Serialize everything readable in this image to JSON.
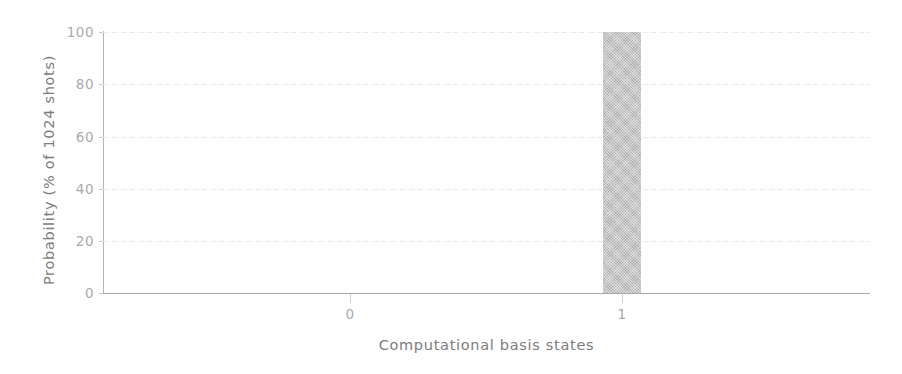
{
  "chart_data": {
    "type": "bar",
    "title": "",
    "subtitle": "",
    "xlabel": "Computational basis states",
    "ylabel": "Probability (% of 1024 shots)",
    "categories": [
      "0",
      "1"
    ],
    "values": [
      0,
      100
    ],
    "series": [
      {
        "name": "Probability",
        "values": [
          0,
          100
        ]
      }
    ],
    "ylim": [
      0,
      100
    ],
    "yticks": [
      0,
      20,
      40,
      60,
      80,
      100
    ],
    "ytick_labels": [
      "0",
      "20",
      "40",
      "60",
      "80",
      "100"
    ],
    "xtick_labels": [
      "0",
      "1"
    ],
    "grid": true,
    "grid_axis": "y",
    "legend": false,
    "legend_position": "none",
    "bar_color": "#b9b9b9",
    "axis_color": "#b0b0b0",
    "grid_color": "#eaeaea",
    "text_color": "#8a8a8a",
    "background": "#fefefe",
    "annotations": []
  },
  "figure": {
    "y_axis_title": "Probability (% of 1024 shots)",
    "x_axis_title": "Computational basis states"
  }
}
